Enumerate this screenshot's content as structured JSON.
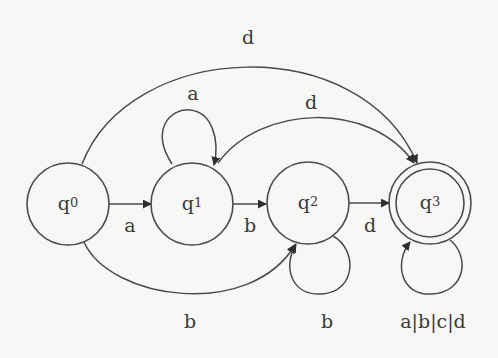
{
  "diagram": {
    "type": "finite-automaton",
    "background": "#f7f7f5",
    "stroke_color": "#4a4a4a",
    "states": [
      {
        "id": "q0",
        "base": "q",
        "index": "0",
        "accepting": false
      },
      {
        "id": "q1",
        "base": "q",
        "index": "1",
        "accepting": false
      },
      {
        "id": "q2",
        "base": "q",
        "index": "2",
        "accepting": false
      },
      {
        "id": "q3",
        "base": "q",
        "index": "3",
        "accepting": true
      }
    ],
    "transitions": [
      {
        "from": "q0",
        "to": "q1",
        "label": "a"
      },
      {
        "from": "q0",
        "to": "q2",
        "label": "b"
      },
      {
        "from": "q0",
        "to": "q3",
        "label": "d"
      },
      {
        "from": "q1",
        "to": "q1",
        "label": "a"
      },
      {
        "from": "q1",
        "to": "q2",
        "label": "b"
      },
      {
        "from": "q1",
        "to": "q3",
        "label": "d"
      },
      {
        "from": "q2",
        "to": "q2",
        "label": "b"
      },
      {
        "from": "q2",
        "to": "q3",
        "label": "d"
      },
      {
        "from": "q3",
        "to": "q3",
        "label": "a|b|c|d"
      }
    ]
  }
}
